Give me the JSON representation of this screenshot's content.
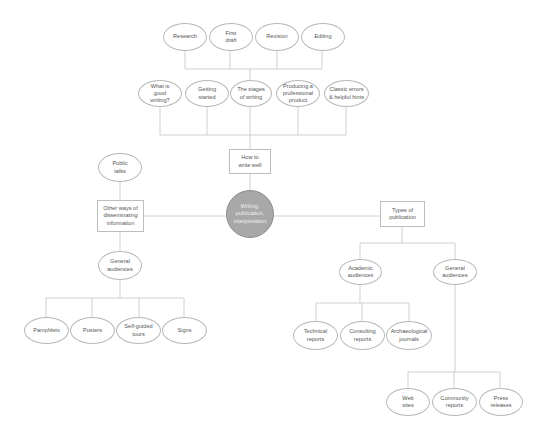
{
  "diagram": {
    "center": {
      "label": "Writing,\npublication,\ninterpretation",
      "fill": "#a8a8a8"
    },
    "how_to_write": {
      "label": "How to\nwrite well",
      "topics": [
        {
          "label": "What is\ngood\nwriting?"
        },
        {
          "label": "Getting\nstarted"
        },
        {
          "label": "The stages\nof writing"
        },
        {
          "label": "Producing a\nprofessional\nproduct"
        },
        {
          "label": "Classic errors\n& helpful hints"
        }
      ],
      "stages": [
        {
          "label": "Research"
        },
        {
          "label": "First\ndraft"
        },
        {
          "label": "Revision"
        },
        {
          "label": "Editing"
        }
      ]
    },
    "other_ways": {
      "label": "Other ways of\ndisseminating\ninformation",
      "public_talks": {
        "label": "Public\ntalks"
      },
      "general_audiences": {
        "label": "General\naudiences"
      },
      "items": [
        {
          "label": "Pamphlets"
        },
        {
          "label": "Posters"
        },
        {
          "label": "Self-guided\ntours"
        },
        {
          "label": "Signs"
        }
      ]
    },
    "types_of_publication": {
      "label": "Types of\npublication",
      "academic": {
        "label": "Academic\naudiences",
        "items": [
          {
            "label": "Technical\nreports"
          },
          {
            "label": "Consulting\nreports"
          },
          {
            "label": "Archaeological\njournals"
          }
        ]
      },
      "general": {
        "label": "General\naudiences",
        "items": [
          {
            "label": "Web\nsites"
          },
          {
            "label": "Community\nreports"
          },
          {
            "label": "Press\nreleases"
          }
        ]
      }
    }
  }
}
